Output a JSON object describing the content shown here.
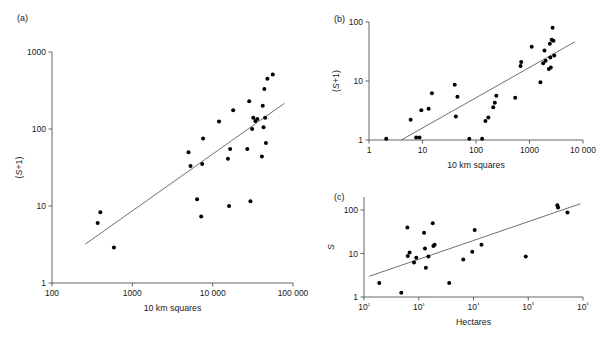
{
  "figure": {
    "width": 600,
    "height": 347,
    "background": "#ffffff",
    "ink_color": "#1a1a1a",
    "axis_color": "#555555",
    "point_color": "#000000"
  },
  "panels": [
    {
      "key": "a",
      "label": "(a)",
      "xlabel": "10 km squares",
      "ylabel": "(S+1)",
      "xticks": [
        "100",
        "1000",
        "10 000",
        "100 000"
      ],
      "yticks": [
        "1",
        "10",
        "100",
        "1000"
      ]
    },
    {
      "key": "b",
      "label": "(b)",
      "xlabel": "10 km squares",
      "ylabel": "(S+1)",
      "xticks": [
        "1",
        "10",
        "100",
        "1000",
        "10 000"
      ],
      "yticks": [
        "1",
        "10",
        "100"
      ]
    },
    {
      "key": "c",
      "label": "(c)",
      "xlabel": "Hectares",
      "ylabel": "S",
      "xticks": [
        "10²",
        "10³",
        "10⁴",
        "10⁵",
        "10⁶"
      ],
      "yticks": [
        "1",
        "10",
        "100"
      ]
    }
  ],
  "chart_data": [
    {
      "type": "scatter",
      "panel": "a",
      "title": "(a)",
      "xlabel": "10 km squares",
      "ylabel": "(S+1)",
      "xscale": "log",
      "yscale": "log",
      "xlim": [
        100,
        100000
      ],
      "ylim": [
        1,
        1000
      ],
      "xticks": [
        100,
        1000,
        10000,
        100000
      ],
      "xticklabels": [
        "100",
        "1000",
        "10 000",
        "100 000"
      ],
      "yticks": [
        1,
        10,
        100,
        1000
      ],
      "yticklabels": [
        "1",
        "10",
        "100",
        "1000"
      ],
      "grid": false,
      "legend": false,
      "points": [
        [
          370,
          6.0
        ],
        [
          400,
          8.3
        ],
        [
          590,
          2.9
        ],
        [
          5000,
          50
        ],
        [
          5300,
          33
        ],
        [
          6400,
          12.2
        ],
        [
          7200,
          7.3
        ],
        [
          7400,
          35
        ],
        [
          7600,
          75
        ],
        [
          12000,
          125
        ],
        [
          15500,
          41
        ],
        [
          16000,
          10.0
        ],
        [
          16500,
          55
        ],
        [
          18000,
          175
        ],
        [
          27000,
          55
        ],
        [
          28500,
          230
        ],
        [
          29500,
          11.5
        ],
        [
          31000,
          100
        ],
        [
          32000,
          140
        ],
        [
          34000,
          127
        ],
        [
          36000,
          135
        ],
        [
          41000,
          44
        ],
        [
          42000,
          200
        ],
        [
          43000,
          105
        ],
        [
          44000,
          330
        ],
        [
          45000,
          140
        ],
        [
          46000,
          66
        ],
        [
          48000,
          450
        ],
        [
          56000,
          510
        ]
      ],
      "fit_line": {
        "description": "log-log least squares fit",
        "endpoints": [
          [
            260,
            3.2
          ],
          [
            78000,
            215
          ]
        ]
      }
    },
    {
      "type": "scatter",
      "panel": "b",
      "title": "(b)",
      "xlabel": "10 km squares",
      "ylabel": "(S+1)",
      "xscale": "log",
      "yscale": "log",
      "xlim": [
        1,
        10000
      ],
      "ylim": [
        1,
        100
      ],
      "xticks": [
        1,
        10,
        100,
        1000,
        10000
      ],
      "xticklabels": [
        "1",
        "10",
        "100",
        "1000",
        "10 000"
      ],
      "yticks": [
        1,
        10,
        100
      ],
      "yticklabels": [
        "1",
        "10",
        "100"
      ],
      "grid": false,
      "legend": false,
      "points": [
        [
          2.1,
          1.05
        ],
        [
          6.0,
          2.2
        ],
        [
          7.6,
          1.1
        ],
        [
          8.8,
          1.1
        ],
        [
          9.5,
          3.2
        ],
        [
          13,
          3.4
        ],
        [
          15,
          6.2
        ],
        [
          40,
          8.6
        ],
        [
          42,
          2.5
        ],
        [
          45,
          5.4
        ],
        [
          75,
          1.05
        ],
        [
          130,
          1.05
        ],
        [
          150,
          2.1
        ],
        [
          170,
          2.4
        ],
        [
          210,
          3.6
        ],
        [
          225,
          4.3
        ],
        [
          240,
          5.6
        ],
        [
          540,
          5.2
        ],
        [
          680,
          18
        ],
        [
          700,
          21
        ],
        [
          1100,
          38
        ],
        [
          1600,
          9.5
        ],
        [
          1800,
          20
        ],
        [
          1900,
          33
        ],
        [
          2000,
          22
        ],
        [
          2300,
          16
        ],
        [
          2400,
          43
        ],
        [
          2450,
          25
        ],
        [
          2500,
          17
        ],
        [
          2600,
          50
        ],
        [
          2700,
          80
        ],
        [
          2800,
          48
        ],
        [
          2900,
          27
        ]
      ],
      "fit_line": {
        "description": "log-log least squares fit",
        "endpoints": [
          [
            4.0,
            1.0
          ],
          [
            7000,
            46
          ]
        ]
      }
    },
    {
      "type": "scatter",
      "panel": "c",
      "title": "(c)",
      "xlabel": "Hectares",
      "ylabel": "S",
      "xscale": "log",
      "yscale": "log",
      "xlim": [
        100,
        1000000
      ],
      "ylim": [
        1,
        200
      ],
      "xticks": [
        100,
        1000,
        10000,
        100000,
        1000000
      ],
      "xticklabels": [
        "10²",
        "10³",
        "10⁴",
        "10⁵",
        "10⁶"
      ],
      "yticks": [
        1,
        10,
        100
      ],
      "yticklabels": [
        "1",
        "10",
        "100"
      ],
      "grid": false,
      "legend": false,
      "points": [
        [
          190,
          2.1
        ],
        [
          480,
          1.25
        ],
        [
          620,
          40
        ],
        [
          630,
          8.8
        ],
        [
          680,
          10.5
        ],
        [
          820,
          6.2
        ],
        [
          900,
          8.0
        ],
        [
          1250,
          30
        ],
        [
          1300,
          13
        ],
        [
          1350,
          4.7
        ],
        [
          1500,
          8.6
        ],
        [
          1800,
          50
        ],
        [
          1850,
          15
        ],
        [
          1950,
          16
        ],
        [
          3600,
          2.1
        ],
        [
          6500,
          7.3
        ],
        [
          9500,
          11
        ],
        [
          10500,
          35
        ],
        [
          14000,
          16
        ],
        [
          90000,
          8.6
        ],
        [
          340000,
          130
        ],
        [
          350000,
          115
        ],
        [
          520000,
          88
        ]
      ],
      "fit_line": {
        "description": "log-log least squares fit",
        "endpoints": [
          [
            125,
            3.0
          ],
          [
            900000,
            140
          ]
        ]
      }
    }
  ]
}
